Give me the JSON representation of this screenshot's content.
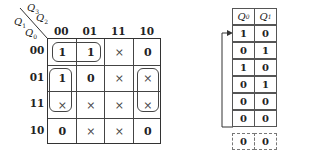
{
  "kmap": {
    "axis_vars": {
      "top_a": "Q",
      "top_a_sub": "3",
      "top_a_sup": "n",
      "top_b": "Q",
      "top_b_sub": "2",
      "top_b_sup": "n",
      "left_a": "Q",
      "left_a_sub": "1",
      "left_a_sup": "n",
      "left_b": "Q",
      "left_b_sub": "0",
      "left_b_sup": "n"
    },
    "col_labels": [
      "00",
      "01",
      "11",
      "10"
    ],
    "row_labels": [
      "00",
      "01",
      "11",
      "10"
    ],
    "cells": [
      [
        "1",
        "1",
        "×",
        "0"
      ],
      [
        "1",
        "0",
        "×",
        "×"
      ],
      [
        "×",
        "×",
        "×",
        "×"
      ],
      [
        "0",
        "×",
        "×",
        "0"
      ]
    ]
  },
  "table": {
    "headers": [
      "Q",
      "Q"
    ],
    "header_subs": [
      "0",
      "1"
    ],
    "rows": [
      [
        "1",
        "0"
      ],
      [
        "0",
        "1"
      ],
      [
        "1",
        "0"
      ],
      [
        "0",
        "1"
      ],
      [
        "0",
        "0"
      ],
      [
        "0",
        "0"
      ]
    ],
    "dashed_row": [
      "0",
      "0"
    ]
  }
}
